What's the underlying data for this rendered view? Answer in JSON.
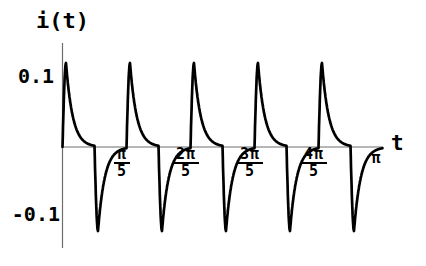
{
  "figure": {
    "y_axis_label": "i(t)",
    "x_axis_label": "t",
    "y_ticks": [
      {
        "label": "0.1"
      },
      {
        "label": "-0.1"
      }
    ],
    "x_ticks": [
      {
        "numerator": "π",
        "denominator": "5"
      },
      {
        "numerator": "2π",
        "denominator": "5"
      },
      {
        "numerator": "3π",
        "denominator": "5"
      },
      {
        "numerator": "4π",
        "denominator": "5"
      },
      {
        "numerator": "π",
        "denominator": ""
      }
    ]
  },
  "chart_data": {
    "type": "line",
    "title": "i(t)",
    "xlabel": "t",
    "ylabel": "i(t)",
    "x_range": [
      0,
      3.14159265
    ],
    "ylim": [
      -0.15,
      0.15
    ],
    "y_tick_values": [
      0.1,
      -0.1
    ],
    "x_tick_values": [
      0.62832,
      1.25664,
      1.88496,
      2.51327,
      3.14159
    ],
    "x_tick_labels": [
      "π/5",
      "2π/5",
      "3π/5",
      "4π/5",
      "π"
    ],
    "periods": 5,
    "period": 0.62832,
    "amplitude": 0.12,
    "waveform": "alternating exponential current spikes: in each period a near-vertical rise to +0.12 followed by exponential decay to 0, then at half-period a near-vertical fall to -0.12 followed by exponential recovery to 0",
    "tau_fraction_of_period": 0.105,
    "edge_fraction_of_period": 0.055,
    "grid": false,
    "legend": false,
    "curve_color": "#000000",
    "axis_color": "#6e6e6e",
    "background_color": "#ffffff"
  }
}
